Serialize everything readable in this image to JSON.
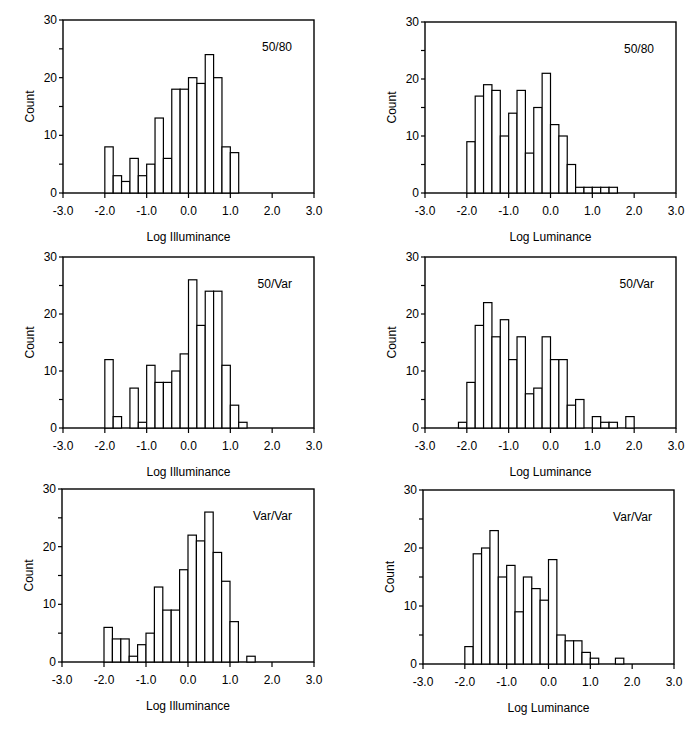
{
  "chart_data": [
    {
      "type": "bar",
      "panel": "top-left",
      "label": "50/80",
      "xlabel": "Log Illuminance",
      "ylabel": "Count",
      "xlim": [
        -3.0,
        3.0
      ],
      "ylim": [
        0,
        30
      ],
      "xticks": [
        "-3.0",
        "-2.0",
        "-1.0",
        "0.0",
        "1.0",
        "2.0",
        "3.0"
      ],
      "yticks": [
        "0",
        "10",
        "20",
        "30"
      ],
      "bin_width": 0.2,
      "bin_start": -2.0,
      "values": [
        8,
        3,
        2,
        6,
        3,
        5,
        13,
        6,
        18,
        18,
        20,
        19,
        24,
        20,
        8,
        7
      ]
    },
    {
      "type": "bar",
      "panel": "top-right",
      "label": "50/80",
      "xlabel": "Log Luminance",
      "ylabel": "Count",
      "xlim": [
        -3.0,
        3.0
      ],
      "ylim": [
        0,
        30
      ],
      "xticks": [
        "-3.0",
        "-2.0",
        "-1.0",
        "0.0",
        "1.0",
        "2.0",
        "3.0"
      ],
      "yticks": [
        "0",
        "10",
        "20",
        "30"
      ],
      "bin_width": 0.2,
      "bin_start": -2.0,
      "values": [
        9,
        17,
        19,
        18,
        10,
        14,
        18,
        7,
        15,
        21,
        12,
        10,
        5,
        1,
        1,
        1,
        1,
        1
      ]
    },
    {
      "type": "bar",
      "panel": "middle-left",
      "label": "50/Var",
      "xlabel": "Log Illuminance",
      "ylabel": "Count",
      "xlim": [
        -3.0,
        3.0
      ],
      "ylim": [
        0,
        30
      ],
      "xticks": [
        "-3.0",
        "-2.0",
        "-1.0",
        "0.0",
        "1.0",
        "2.0",
        "3.0"
      ],
      "yticks": [
        "0",
        "10",
        "20",
        "30"
      ],
      "bin_width": 0.2,
      "bin_start": -2.0,
      "values": [
        12,
        2,
        0,
        7,
        1,
        11,
        8,
        8,
        10,
        13,
        26,
        18,
        24,
        24,
        11,
        4,
        1
      ]
    },
    {
      "type": "bar",
      "panel": "middle-right",
      "label": "50/Var",
      "xlabel": "Log Luminance",
      "ylabel": "Count",
      "xlim": [
        -3.0,
        3.0
      ],
      "ylim": [
        0,
        30
      ],
      "xticks": [
        "-3.0",
        "-2.0",
        "-1.0",
        "0.0",
        "1.0",
        "2.0",
        "3.0"
      ],
      "yticks": [
        "0",
        "10",
        "20",
        "30"
      ],
      "bin_width": 0.2,
      "bin_start": -2.2,
      "values": [
        1,
        8,
        18,
        22,
        16,
        19,
        12,
        16,
        6,
        7,
        16,
        12,
        12,
        4,
        5,
        0,
        2,
        1,
        1,
        0,
        2
      ]
    },
    {
      "type": "bar",
      "panel": "bottom-left",
      "label": "Var/Var",
      "xlabel": "Log Illuminance",
      "ylabel": "Count",
      "xlim": [
        -3.0,
        3.0
      ],
      "ylim": [
        0,
        30
      ],
      "xticks": [
        "-3.0",
        "-2.0",
        "-1.0",
        "0.0",
        "1.0",
        "2.0",
        "3.0"
      ],
      "yticks": [
        "0",
        "10",
        "20",
        "30"
      ],
      "bin_width": 0.2,
      "bin_start": -2.0,
      "values": [
        6,
        4,
        4,
        1,
        3,
        5,
        13,
        9,
        9,
        16,
        22,
        21,
        26,
        19,
        14,
        7,
        0,
        1
      ]
    },
    {
      "type": "bar",
      "panel": "bottom-right",
      "label": "Var/Var",
      "xlabel": "Log Luminance",
      "ylabel": "Count",
      "xlim": [
        -3.0,
        3.0
      ],
      "ylim": [
        0,
        30
      ],
      "xticks": [
        "-3.0",
        "-2.0",
        "-1.0",
        "0.0",
        "1.0",
        "2.0",
        "3.0"
      ],
      "yticks": [
        "0",
        "10",
        "20",
        "30"
      ],
      "bin_width": 0.2,
      "bin_start": -2.0,
      "values": [
        3,
        19,
        20,
        23,
        15,
        17,
        9,
        15,
        13,
        11,
        18,
        5,
        4,
        4,
        2,
        1,
        0,
        0,
        1
      ]
    }
  ]
}
